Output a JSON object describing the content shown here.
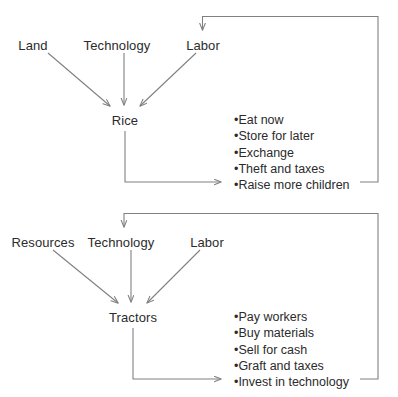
{
  "diagram": {
    "type": "flow-diagram",
    "background_color": "#ffffff",
    "text_color": "#2b2b2b",
    "line_color": "#808080",
    "bullet_char": "•",
    "panels": [
      {
        "id": "rice-panel",
        "output_node": "Rice",
        "inputs": [
          "Land",
          "Technology",
          "Labor"
        ],
        "feedback_target": "Labor",
        "outcomes": [
          "Eat now",
          "Store for later",
          "Exchange",
          "Theft and taxes",
          "Raise more children"
        ]
      },
      {
        "id": "tractors-panel",
        "output_node": "Tractors",
        "inputs": [
          "Resources",
          "Technology",
          "Labor"
        ],
        "feedback_target": "Technology",
        "outcomes": [
          "Pay workers",
          "Buy materials",
          "Sell for cash",
          "Graft and taxes",
          "Invest in technology"
        ]
      }
    ],
    "labels": {
      "top_land": "Land",
      "top_technology": "Technology",
      "top_labor": "Labor",
      "top_output": "Rice",
      "bottom_resources": "Resources",
      "bottom_technology": "Technology",
      "bottom_labor": "Labor",
      "bottom_output": "Tractors"
    },
    "top_bullets": [
      "Eat now",
      "Store for later",
      "Exchange",
      "Theft and taxes",
      "Raise more children"
    ],
    "bottom_bullets": [
      "Pay workers",
      "Buy materials",
      "Sell for cash",
      "Graft and taxes",
      "Invest in technology"
    ]
  }
}
